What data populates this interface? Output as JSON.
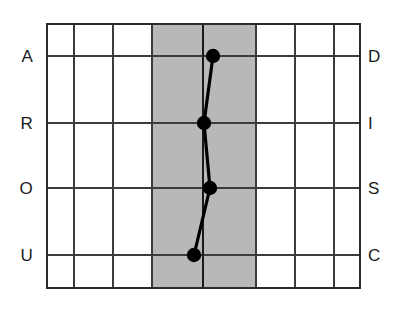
{
  "chart": {
    "title": "",
    "type": "line"
  },
  "colors": {
    "grid_line": "#3c3c3c",
    "border_line": "#2b2b2b",
    "shaded_band": "#b8b8b8",
    "center_line": "#1a1a1a",
    "data_line": "#000000",
    "data_marker": "#000000",
    "background": "#ffffff",
    "label_text": "#1a1a1a"
  },
  "axes": {
    "left_labels": [
      "A",
      "R",
      "O",
      "U"
    ],
    "right_labels": [
      "D",
      "I",
      "S",
      "C"
    ],
    "left_axis_name": "AROU",
    "right_axis_name": "DISC"
  },
  "geometry": {
    "plot_left": 47,
    "plot_right": 360,
    "plot_top": 24,
    "plot_bottom": 288,
    "column_lines": [
      47,
      74,
      113,
      152,
      203,
      256,
      295,
      334,
      360
    ],
    "row_lines": [
      24,
      56,
      123,
      188,
      255,
      288
    ],
    "shaded_band_start": 152,
    "shaded_band_end": 256,
    "center_line_x": 203,
    "label_left_x": 33,
    "label_right_x": 368
  },
  "chart_data": {
    "type": "line",
    "title": "",
    "xlabel": "",
    "ylabel": "",
    "categories": [
      "D",
      "I",
      "S",
      "C"
    ],
    "left_categories": [
      "A",
      "R",
      "O",
      "U"
    ],
    "grid": true,
    "legend": "none",
    "xlim": [
      47,
      360
    ],
    "ylim": [
      24,
      288
    ],
    "center_baseline": 203,
    "shaded_region": [
      152,
      256
    ],
    "series": [
      {
        "name": "Profile",
        "points": [
          {
            "label": "D",
            "left_label": "A",
            "x": 213,
            "y": 56,
            "offset_from_center": 10
          },
          {
            "label": "I",
            "left_label": "R",
            "x": 204,
            "y": 123,
            "offset_from_center": 1
          },
          {
            "label": "S",
            "left_label": "O",
            "x": 210,
            "y": 188,
            "offset_from_center": 7
          },
          {
            "label": "C",
            "left_label": "U",
            "x": 194,
            "y": 255,
            "offset_from_center": -9
          }
        ]
      }
    ]
  },
  "row_positions": [
    {
      "y": 56,
      "left": "A",
      "right": "D"
    },
    {
      "y": 123,
      "left": "R",
      "right": "I"
    },
    {
      "y": 188,
      "left": "O",
      "right": "S"
    },
    {
      "y": 255,
      "left": "U",
      "right": "C"
    }
  ]
}
